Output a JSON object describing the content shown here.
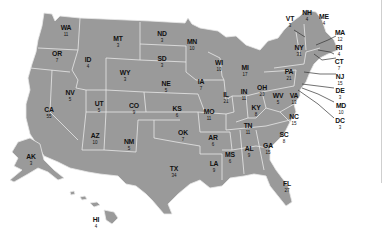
{
  "map": {
    "subject": "US Electoral Votes by State",
    "fill_color": "#9a9a9a",
    "border_color": "#e9e9e9",
    "label_color": "#111111",
    "states": [
      {
        "abbr": "WA",
        "ev": "11"
      },
      {
        "abbr": "OR",
        "ev": "7"
      },
      {
        "abbr": "CA",
        "ev": "55"
      },
      {
        "abbr": "ID",
        "ev": "4"
      },
      {
        "abbr": "NV",
        "ev": "5"
      },
      {
        "abbr": "MT",
        "ev": "3"
      },
      {
        "abbr": "WY",
        "ev": "3"
      },
      {
        "abbr": "UT",
        "ev": "5"
      },
      {
        "abbr": "AZ",
        "ev": "10"
      },
      {
        "abbr": "CO",
        "ev": "9"
      },
      {
        "abbr": "NM",
        "ev": "5"
      },
      {
        "abbr": "ND",
        "ev": "3"
      },
      {
        "abbr": "SD",
        "ev": "3"
      },
      {
        "abbr": "NE",
        "ev": "5"
      },
      {
        "abbr": "KS",
        "ev": "6"
      },
      {
        "abbr": "OK",
        "ev": "7"
      },
      {
        "abbr": "TX",
        "ev": "34"
      },
      {
        "abbr": "MN",
        "ev": "10"
      },
      {
        "abbr": "IA",
        "ev": "7"
      },
      {
        "abbr": "MO",
        "ev": "11"
      },
      {
        "abbr": "AR",
        "ev": "6"
      },
      {
        "abbr": "LA",
        "ev": "9"
      },
      {
        "abbr": "WI",
        "ev": "10"
      },
      {
        "abbr": "IL",
        "ev": "21"
      },
      {
        "abbr": "MS",
        "ev": "6"
      },
      {
        "abbr": "MI",
        "ev": "17"
      },
      {
        "abbr": "IN",
        "ev": "11"
      },
      {
        "abbr": "KY",
        "ev": "8"
      },
      {
        "abbr": "TN",
        "ev": "11"
      },
      {
        "abbr": "AL",
        "ev": "9"
      },
      {
        "abbr": "OH",
        "ev": "20"
      },
      {
        "abbr": "GA",
        "ev": "15"
      },
      {
        "abbr": "FL",
        "ev": "27"
      },
      {
        "abbr": "SC",
        "ev": "8"
      },
      {
        "abbr": "NC",
        "ev": "15"
      },
      {
        "abbr": "VA",
        "ev": "13"
      },
      {
        "abbr": "WV",
        "ev": "5"
      },
      {
        "abbr": "PA",
        "ev": "21"
      },
      {
        "abbr": "NY",
        "ev": "31"
      },
      {
        "abbr": "VT",
        "ev": "3"
      },
      {
        "abbr": "NH",
        "ev": "4"
      },
      {
        "abbr": "ME",
        "ev": "4"
      },
      {
        "abbr": "MA",
        "ev": "12"
      },
      {
        "abbr": "RI",
        "ev": "4"
      },
      {
        "abbr": "CT",
        "ev": "7"
      },
      {
        "abbr": "NJ",
        "ev": "15"
      },
      {
        "abbr": "DE",
        "ev": "3"
      },
      {
        "abbr": "MD",
        "ev": "10"
      },
      {
        "abbr": "DC",
        "ev": "3"
      },
      {
        "abbr": "AK",
        "ev": "3"
      },
      {
        "abbr": "HI",
        "ev": "4"
      }
    ]
  }
}
